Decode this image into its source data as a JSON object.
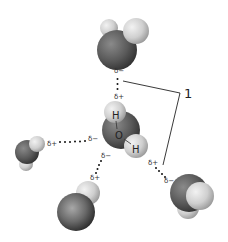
{
  "diagram": {
    "partial_charges": {
      "top_delta_minus": "δ−",
      "top_delta_plus": "δ+",
      "left_delta_plus": "δ+",
      "left_delta_minus": "δ−",
      "bottom_left_delta_minus": "δ−",
      "bottom_left_delta_plus": "δ+",
      "bottom_right_delta_plus": "δ+",
      "bottom_right_delta_minus": "δ−"
    },
    "central_molecule": {
      "hydrogen_top_label": "H",
      "oxygen_label": "O",
      "hydrogen_right_label": "H"
    },
    "callout": {
      "number": "1"
    },
    "colors": {
      "oxygen": "#5a5a5a",
      "hydrogen": "#d4d4d4",
      "bond_dots": "#111111",
      "callout_line": "#222222"
    }
  }
}
